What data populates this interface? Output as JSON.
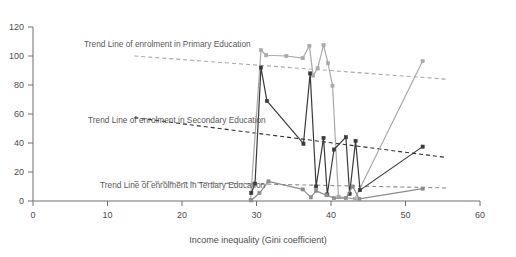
{
  "chart_data": {
    "type": "line",
    "title": "",
    "xlabel": "Income inequality (Gini coefficient)",
    "ylabel": "",
    "xlim": [
      0,
      60
    ],
    "ylim": [
      0,
      120
    ],
    "xticks": [
      0,
      10,
      20,
      30,
      40,
      50,
      60
    ],
    "yticks": [
      0,
      20,
      40,
      60,
      80,
      100,
      120
    ],
    "grid": false,
    "legend_position": "inline-annotations",
    "annotations": [
      "Trend Line of enrolment in Primary Education",
      "Trend Line of enrolment in Secondary Education",
      "Trend Line of enrolment in Tertiary Education"
    ],
    "series": [
      {
        "name": "Enrolment in Primary Education",
        "color": "#a9a9a9",
        "marker": "square",
        "points": [
          [
            29.2,
            0.5
          ],
          [
            30.6,
            104.0
          ],
          [
            31.3,
            100.5
          ],
          [
            34.0,
            100.0
          ],
          [
            36.2,
            98.5
          ],
          [
            37.1,
            107.0
          ],
          [
            37.6,
            86.5
          ],
          [
            38.2,
            91.5
          ],
          [
            39.0,
            107.5
          ],
          [
            39.6,
            95.0
          ],
          [
            40.2,
            79.5
          ],
          [
            41.0,
            3.0
          ],
          [
            43.2,
            1.5
          ],
          [
            52.3,
            96.5
          ]
        ]
      },
      {
        "name": "Enrolment in Secondary Education",
        "color": "#3a3a3a",
        "marker": "square",
        "points": [
          [
            29.3,
            5.5
          ],
          [
            29.8,
            12.0
          ],
          [
            30.6,
            92.0
          ],
          [
            31.4,
            69.0
          ],
          [
            36.3,
            39.5
          ],
          [
            37.2,
            88.0
          ],
          [
            38.0,
            10.0
          ],
          [
            39.0,
            43.5
          ],
          [
            39.5,
            4.5
          ],
          [
            40.4,
            35.5
          ],
          [
            42.0,
            44.0
          ],
          [
            42.5,
            5.0
          ],
          [
            43.3,
            41.5
          ],
          [
            43.9,
            7.5
          ],
          [
            52.3,
            37.5
          ]
        ]
      },
      {
        "name": "Enrolment in Tertiary Education",
        "color": "#8c8c8c",
        "marker": "square",
        "points": [
          [
            29.3,
            0.5
          ],
          [
            30.4,
            5.5
          ],
          [
            31.6,
            13.5
          ],
          [
            36.2,
            8.0
          ],
          [
            37.3,
            2.5
          ],
          [
            38.0,
            7.0
          ],
          [
            39.4,
            4.0
          ],
          [
            40.4,
            2.0
          ],
          [
            42.0,
            2.0
          ],
          [
            42.9,
            10.0
          ],
          [
            43.8,
            1.5
          ],
          [
            52.3,
            8.5
          ]
        ]
      }
    ],
    "trend_lines": [
      {
        "name": "Trend Line of enrolment in Primary Education",
        "color": "#a9a9a9",
        "style": "dashed",
        "x_start": 13.6,
        "y_start": 100.0,
        "x_end": 55.5,
        "y_end": 84.0
      },
      {
        "name": "Trend Line of enrolment in Secondary Education",
        "color": "#2f2f2f",
        "style": "dashed",
        "x_start": 13.6,
        "y_start": 57.5,
        "x_end": 55.5,
        "y_end": 30.0
      },
      {
        "name": "Trend Line of enrolment in Tertiary Education",
        "color": "#8c8c8c",
        "style": "dashed",
        "x_start": 13.6,
        "y_start": 13.5,
        "x_end": 55.5,
        "y_end": 9.0
      }
    ]
  },
  "axis": {
    "x_title": "Income inequality (Gini coefficient)",
    "x_tick_labels": [
      "0",
      "10",
      "20",
      "30",
      "40",
      "50",
      "60"
    ],
    "y_tick_labels": [
      "0",
      "20",
      "40",
      "60",
      "80",
      "100",
      "120"
    ]
  },
  "labels": {
    "primary_trend": "Trend Line of enrolment in Primary Education",
    "secondary_trend": "Trend Line of enrolment in Secondary Education",
    "tertiary_trend": "Trend Line of enrolment in Tertiary Education"
  }
}
